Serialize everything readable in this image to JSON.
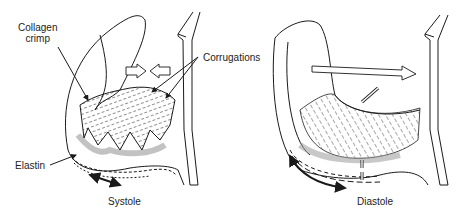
{
  "figure": {
    "panels": [
      {
        "id": "systole",
        "caption": "Systole",
        "labels": {
          "collagen_line1": "Collagen",
          "collagen_line2": "crimp",
          "corrugations": "Corrugations",
          "elastin": "Elastin"
        }
      },
      {
        "id": "diastole",
        "caption": "Diastole"
      }
    ],
    "colors": {
      "line": "#1a1a1a",
      "shadow": "#9a9a9a",
      "background": "#ffffff"
    }
  }
}
